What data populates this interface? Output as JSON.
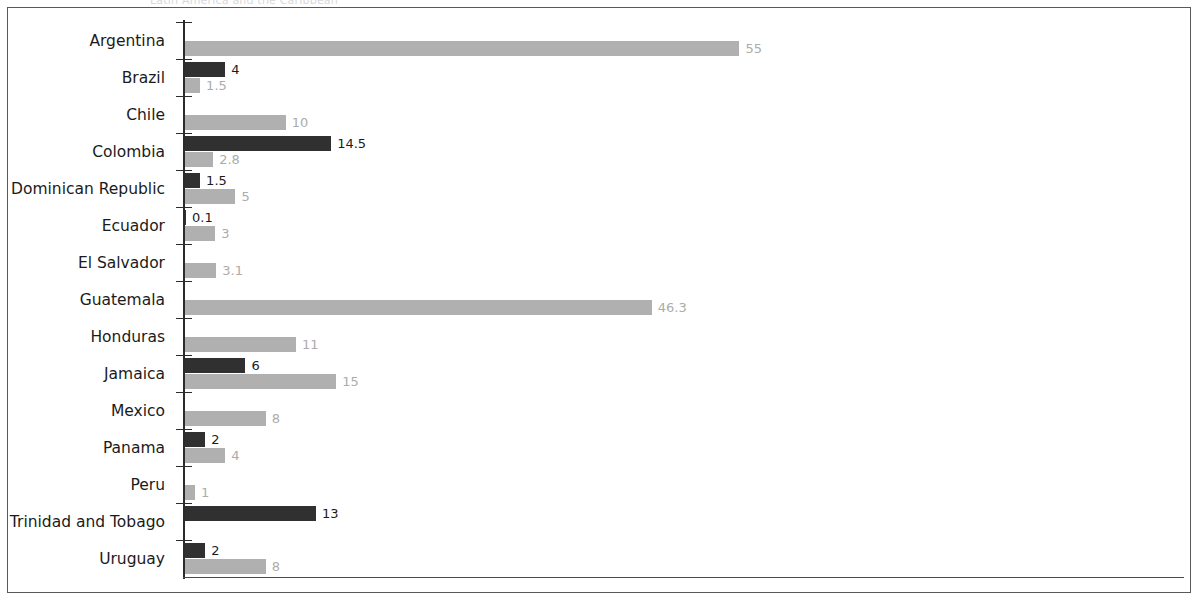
{
  "figure": {
    "title_partial": "Latin America and the Caribbean",
    "frame": true
  },
  "colors": {
    "dark_series": "#303030",
    "light_series": "#b0b0b0",
    "axis": "#2b2b2b",
    "frame": "#595959",
    "dark_label": "#1b1b1b",
    "light_label": "#acacac",
    "background": "#ffffff"
  },
  "chart_data": {
    "type": "bar",
    "orientation": "horizontal",
    "title": "Latin America and the Caribbean",
    "xlabel": "",
    "ylabel": "",
    "xlim": [
      0,
      99
    ],
    "grid": false,
    "legend": "none",
    "categories": [
      "Argentina",
      "Brazil",
      "Chile",
      "Colombia",
      "Dominican Republic",
      "Ecuador",
      "El Salvador",
      "Guatemala",
      "Honduras",
      "Jamaica",
      "Mexico",
      "Panama",
      "Peru",
      "Trinidad and Tobago",
      "Uruguay"
    ],
    "series": [
      {
        "name": "dark",
        "color": "#303030",
        "values": [
          null,
          4,
          null,
          14.5,
          1.5,
          0.1,
          null,
          null,
          null,
          6,
          null,
          2,
          null,
          13,
          2
        ],
        "labels": [
          "",
          "4",
          "",
          "14.5",
          "1.5",
          "0.1",
          "",
          "",
          "",
          "6",
          "",
          "2",
          "",
          "13",
          "2"
        ]
      },
      {
        "name": "light",
        "color": "#b0b0b0",
        "values": [
          55,
          1.5,
          10,
          2.8,
          5,
          3,
          3.1,
          46.3,
          11,
          15,
          8,
          4,
          1,
          null,
          8
        ],
        "labels": [
          "55",
          "1.5",
          "10",
          "2.8",
          "5",
          "3",
          "3.1",
          "46.3",
          "11",
          "15",
          "8",
          "4",
          "1",
          "",
          "8"
        ]
      }
    ],
    "px_per_unit": 10.08
  },
  "rows": [
    {
      "label": "Argentina",
      "dark": null,
      "dark_label": "",
      "light": 55,
      "light_label": "55"
    },
    {
      "label": "Brazil",
      "dark": 4,
      "dark_label": "4",
      "light": 1.5,
      "light_label": "1.5"
    },
    {
      "label": "Chile",
      "dark": null,
      "dark_label": "",
      "light": 10,
      "light_label": "10"
    },
    {
      "label": "Colombia",
      "dark": 14.5,
      "dark_label": "14.5",
      "light": 2.8,
      "light_label": "2.8"
    },
    {
      "label": "Dominican Republic",
      "dark": 1.5,
      "dark_label": "1.5",
      "light": 5,
      "light_label": "5"
    },
    {
      "label": "Ecuador",
      "dark": 0.1,
      "dark_label": "0.1",
      "light": 3,
      "light_label": "3"
    },
    {
      "label": "El Salvador",
      "dark": null,
      "dark_label": "",
      "light": 3.1,
      "light_label": "3.1"
    },
    {
      "label": "Guatemala",
      "dark": null,
      "dark_label": "",
      "light": 46.3,
      "light_label": "46.3"
    },
    {
      "label": "Honduras",
      "dark": null,
      "dark_label": "",
      "light": 11,
      "light_label": "11"
    },
    {
      "label": "Jamaica",
      "dark": 6,
      "dark_label": "6",
      "light": 15,
      "light_label": "15"
    },
    {
      "label": "Mexico",
      "dark": null,
      "dark_label": "",
      "light": 8,
      "light_label": "8"
    },
    {
      "label": "Panama",
      "dark": 2,
      "dark_label": "2",
      "light": 4,
      "light_label": "4"
    },
    {
      "label": "Peru",
      "dark": null,
      "dark_label": "",
      "light": 1,
      "light_label": "1"
    },
    {
      "label": "Trinidad and Tobago",
      "dark": 13,
      "dark_label": "13",
      "light": null,
      "light_label": ""
    },
    {
      "label": "Uruguay",
      "dark": 2,
      "dark_label": "2",
      "light": 8,
      "light_label": "8"
    }
  ]
}
